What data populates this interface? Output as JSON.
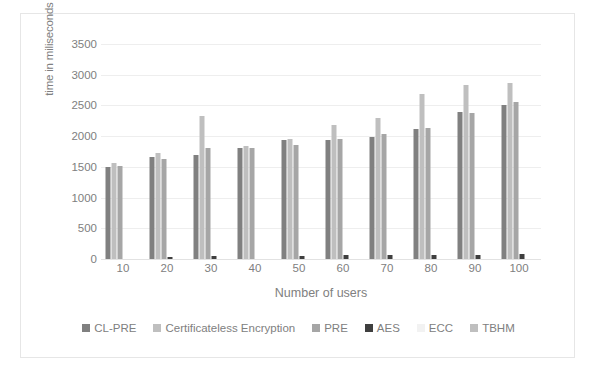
{
  "chart_data": {
    "type": "bar",
    "title": "",
    "xlabel": "Number of users",
    "ylabel": "time in miliseconds",
    "categories": [
      "10",
      "20",
      "30",
      "40",
      "50",
      "60",
      "70",
      "80",
      "90",
      "100"
    ],
    "ylim": [
      0,
      3500
    ],
    "yticks": [
      0,
      500,
      1000,
      1500,
      2000,
      2500,
      3000,
      3500
    ],
    "grid": true,
    "legend_position": "bottom",
    "series": [
      {
        "name": "CL-PRE",
        "color": "#808080",
        "values": [
          1490,
          1660,
          1700,
          1810,
          1930,
          1930,
          1990,
          2110,
          2390,
          2500
        ]
      },
      {
        "name": "Certificateless Encryption",
        "color": "#bfbfbf",
        "values": [
          1570,
          1720,
          2330,
          1840,
          1950,
          2180,
          2300,
          2690,
          2830,
          2870
        ]
      },
      {
        "name": "PRE",
        "color": "#a6a6a6",
        "values": [
          1520,
          1630,
          1800,
          1800,
          1860,
          1950,
          2030,
          2140,
          2380,
          2560
        ]
      },
      {
        "name": "AES",
        "color": "#3f3f3f",
        "values": [
          0,
          40,
          55,
          0,
          55,
          60,
          60,
          70,
          70,
          75
        ]
      },
      {
        "name": "ECC",
        "color": "#f2f2f2",
        "values": [
          0,
          0,
          0,
          0,
          0,
          0,
          0,
          0,
          0,
          0
        ]
      },
      {
        "name": "TBHM",
        "color": "#bfbfbf",
        "values": [
          0,
          0,
          0,
          0,
          0,
          0,
          0,
          0,
          0,
          0
        ]
      }
    ]
  },
  "axes": {
    "y_title": "time in miliseconds",
    "x_title": "Number of users"
  },
  "colors": {
    "grid": "#eeeeee",
    "text": "#808080",
    "frame": "#e6e6e6",
    "background": "#ffffff"
  }
}
